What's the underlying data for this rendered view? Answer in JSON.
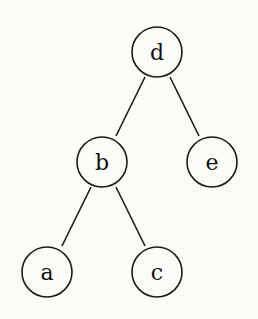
{
  "diagram": {
    "type": "binary-tree",
    "background": "#fcfcf8",
    "stroke_color": "#1a1a1a",
    "node_radius": 25,
    "nodes": [
      {
        "id": "d",
        "label": "d",
        "cx": 157,
        "cy": 52
      },
      {
        "id": "b",
        "label": "b",
        "cx": 102,
        "cy": 162
      },
      {
        "id": "e",
        "label": "e",
        "cx": 212,
        "cy": 162
      },
      {
        "id": "a",
        "label": "a",
        "cx": 47,
        "cy": 272
      },
      {
        "id": "c",
        "label": "c",
        "cx": 157,
        "cy": 272
      }
    ],
    "edges": [
      {
        "from": "d",
        "to": "b",
        "x1": 145,
        "y1": 77,
        "x2": 116,
        "y2": 136
      },
      {
        "from": "d",
        "to": "e",
        "x1": 170,
        "y1": 77,
        "x2": 199,
        "y2": 136
      },
      {
        "from": "b",
        "to": "a",
        "x1": 91,
        "y1": 187,
        "x2": 62,
        "y2": 246
      },
      {
        "from": "b",
        "to": "c",
        "x1": 116,
        "y1": 187,
        "x2": 145,
        "y2": 246
      }
    ]
  }
}
